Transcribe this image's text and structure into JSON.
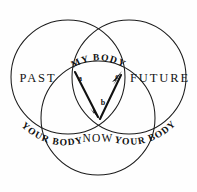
{
  "diagram": {
    "type": "three-circle-venn",
    "background_color": "#fefefe",
    "stroke_color": "#1b1b1b",
    "circles": [
      {
        "id": "past",
        "label": "PAST",
        "cx": 68,
        "cy": 77,
        "r": 57
      },
      {
        "id": "future",
        "label": "FUTURE",
        "cx": 129,
        "cy": 77,
        "r": 57
      },
      {
        "id": "now",
        "label": "NOW",
        "cx": 98,
        "cy": 118,
        "r": 57
      }
    ],
    "region_labels": [
      {
        "name": "past-label",
        "text": "PAST",
        "x": 38,
        "y": 82
      },
      {
        "name": "future-label",
        "text": "FUTURE",
        "x": 160,
        "y": 82
      }
    ],
    "arc_labels": [
      {
        "name": "my-body-label",
        "text": "MY BODY",
        "position": "top-lens"
      },
      {
        "name": "your-body-left-label",
        "text": "YOUR BODY",
        "position": "lower-left-arc"
      },
      {
        "name": "your-body-right-label",
        "text": "YOUR BODY",
        "position": "lower-right-arc"
      }
    ],
    "now_label": {
      "name": "now-label",
      "text": "NOW",
      "x": 98,
      "y": 139
    },
    "point_labels": [
      {
        "name": "point-a",
        "text": "a",
        "x": 80,
        "y": 80
      },
      {
        "name": "point-b",
        "text": "b",
        "x": 102,
        "y": 104
      },
      {
        "name": "point-c",
        "text": "c",
        "x": 117,
        "y": 78
      }
    ],
    "arrows": [
      {
        "name": "arrow-a-to-now",
        "from": {
          "x": 76,
          "y": 73
        },
        "to": {
          "x": 100,
          "y": 119
        },
        "direction": "down-right"
      },
      {
        "name": "arrow-now-to-c",
        "from": {
          "x": 100,
          "y": 119
        },
        "to": {
          "x": 121,
          "y": 73
        },
        "direction": "up-right"
      }
    ]
  }
}
